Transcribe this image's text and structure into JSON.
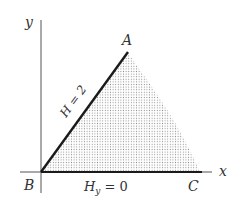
{
  "diagram": {
    "axes": {
      "x_label": "x",
      "y_label": "y"
    },
    "points": {
      "A": "A",
      "B": "B",
      "C": "C"
    },
    "boundary_labels": {
      "BA": "H = 2",
      "BC_main": "H",
      "BC_sub": "y",
      "BC_rest": " = 0"
    },
    "colors": {
      "line": "#1a1a1a",
      "axis": "#444444",
      "shade_dot": "#9a9a9a",
      "text": "#333333",
      "background": "#ffffff"
    }
  }
}
